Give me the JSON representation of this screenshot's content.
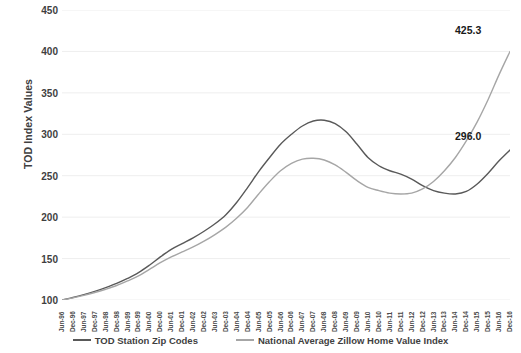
{
  "chart_data": {
    "type": "line",
    "title": "",
    "xlabel": "",
    "ylabel": "TOD Index Values",
    "ylim": [
      100,
      450
    ],
    "ytick_step": 50,
    "yticks": [
      450,
      400,
      350,
      300,
      250,
      200,
      150,
      100
    ],
    "grid": "horizontal",
    "legend_position": "bottom",
    "colors": {
      "tod": "#595959",
      "national": "#a6a6a6",
      "gridline": "#eeeeee",
      "text": "#404040"
    },
    "categories": [
      "Jun-96",
      "Dec-96",
      "Jun-97",
      "Dec-97",
      "Jun-98",
      "Dec-98",
      "Jun-99",
      "Dec-99",
      "Jun-00",
      "Dec-00",
      "Jun-01",
      "Dec-01",
      "Jun-02",
      "Dec-02",
      "Jun-03",
      "Dec-03",
      "Jun-04",
      "Dec-04",
      "Jun-05",
      "Dec-05",
      "Jun-06",
      "Dec-06",
      "Jun-07",
      "Dec-07",
      "Jun-08",
      "Dec-08",
      "Jun-09",
      "Dec-09",
      "Jun-10",
      "Dec-10",
      "Jun-11",
      "Dec-11",
      "Jun-12",
      "Dec-12",
      "Jun-13",
      "Dec-13",
      "Jun-14",
      "Dec-14",
      "Jun-15",
      "Dec-15",
      "Jun-16",
      "Dec-16"
    ],
    "series": [
      {
        "name": "TOD Station Zip Codes",
        "color": "#595959",
        "end_label": "425.3",
        "values": [
          100.0,
          103.0,
          106.5,
          110.5,
          115.0,
          120.0,
          126.0,
          133.0,
          142.0,
          152.0,
          161.0,
          168.0,
          175.0,
          183.0,
          192.0,
          203.0,
          218.0,
          236.0,
          255.0,
          272.0,
          288.0,
          300.0,
          310.0,
          316.0,
          317.0,
          313.0,
          303.0,
          288.0,
          272.0,
          262.0,
          256.0,
          252.0,
          246.0,
          238.0,
          232.0,
          229.0,
          228.0,
          231.0,
          240.0,
          253.0,
          268.0,
          281.0
        ]
      },
      {
        "name": "National Average Zillow Home Value Index",
        "color": "#a6a6a6",
        "end_label": "296.0",
        "values": [
          100.0,
          102.5,
          105.5,
          109.0,
          113.0,
          117.5,
          123.0,
          129.0,
          137.0,
          145.0,
          152.0,
          158.0,
          164.0,
          171.0,
          179.0,
          188.0,
          199.0,
          212.0,
          228.0,
          243.0,
          256.0,
          265.0,
          270.0,
          271.0,
          269.0,
          263.0,
          254.0,
          244.0,
          236.0,
          232.0,
          229.0,
          228.0,
          229.0,
          234.0,
          243.0,
          256.0,
          272.0,
          292.0,
          315.0,
          342.0,
          372.0,
          400.0
        ]
      }
    ],
    "annotations": [
      {
        "id": "tod-end-value",
        "text": "425.3",
        "series": "TOD Station Zip Codes"
      },
      {
        "id": "national-end-value",
        "text": "296.0",
        "series": "National Average Zillow Home Value Index"
      }
    ]
  },
  "axis": {
    "y_title": "TOD Index Values"
  },
  "legend": {
    "items": [
      {
        "label": "TOD Station Zip Codes",
        "color": "#595959"
      },
      {
        "label": "National Average Zillow Home Value Index",
        "color": "#a6a6a6"
      }
    ]
  },
  "caption": ""
}
